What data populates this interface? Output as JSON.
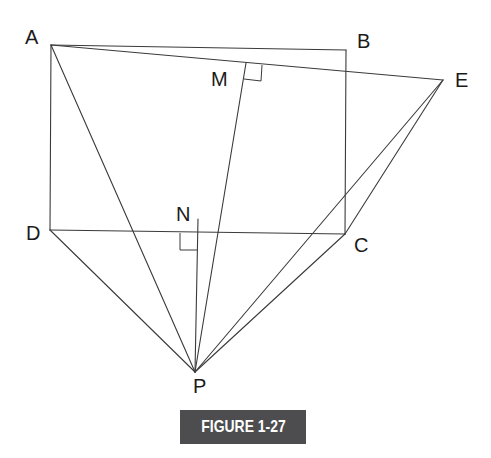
{
  "figure": {
    "caption": "FIGURE 1-27",
    "caption_bg": "#4d4d4f",
    "caption_fg": "#ffffff",
    "line_color": "#3a3a3a"
  },
  "points": {
    "A": {
      "label": "A",
      "x": 51,
      "y": 45
    },
    "B": {
      "label": "B",
      "x": 346,
      "y": 50
    },
    "C": {
      "label": "C",
      "x": 345,
      "y": 234
    },
    "D": {
      "label": "D",
      "x": 50,
      "y": 230
    },
    "E": {
      "label": "E",
      "x": 443,
      "y": 80
    },
    "M": {
      "label": "M",
      "x": 246,
      "y": 63
    },
    "N": {
      "label": "N",
      "x": 198,
      "y": 219
    },
    "P": {
      "label": "P",
      "x": 195,
      "y": 372
    }
  },
  "segments": [
    [
      "A",
      "B"
    ],
    [
      "B",
      "C"
    ],
    [
      "C",
      "D"
    ],
    [
      "D",
      "A"
    ],
    [
      "A",
      "E"
    ],
    [
      "M",
      "P"
    ],
    [
      "A",
      "P"
    ],
    [
      "D",
      "P"
    ],
    [
      "N",
      "P"
    ],
    [
      "C",
      "P"
    ],
    [
      "E",
      "P"
    ],
    [
      "C",
      "E"
    ]
  ],
  "right_angles": [
    "M",
    "N"
  ]
}
